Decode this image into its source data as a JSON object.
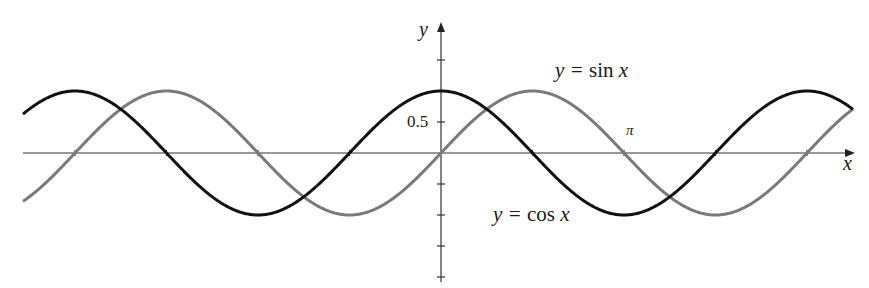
{
  "chart_data": {
    "type": "line",
    "title": "",
    "xlabel": "x",
    "ylabel": "y",
    "x_range": [
      -7.16,
      7.08
    ],
    "ylim": [
      -2.0,
      2.0
    ],
    "grid": false,
    "legend": "inline labels",
    "tick_labels": {
      "y": [
        {
          "value": 0.5,
          "label": "0.5"
        }
      ],
      "x": [
        {
          "value": 3.14159,
          "label": "π"
        }
      ]
    },
    "y_ticks": [
      1.5,
      0.5,
      -0.5,
      -1.0,
      -1.5,
      -2.0
    ],
    "x_ticks_note": "ticks at multiples of π/2",
    "series": [
      {
        "name": "y = sin x",
        "function": "sin",
        "color": "#7a7a7a",
        "amplitude": 1,
        "period": "2π"
      },
      {
        "name": "y = cos x",
        "function": "cos",
        "color": "#111111",
        "amplitude": 1,
        "period": "2π"
      }
    ],
    "annotations": [
      "y = sin x",
      "y = cos x",
      "π",
      "0.5"
    ]
  },
  "labels": {
    "y_axis": "y",
    "x_axis": "x",
    "sin_label_prefix": "y = ",
    "sin_label_fn": "sin",
    "sin_label_var": "x",
    "cos_label_prefix": "y = ",
    "cos_label_fn": "cos",
    "cos_label_var": "x",
    "tick_half": "0.5",
    "tick_pi": "π"
  }
}
